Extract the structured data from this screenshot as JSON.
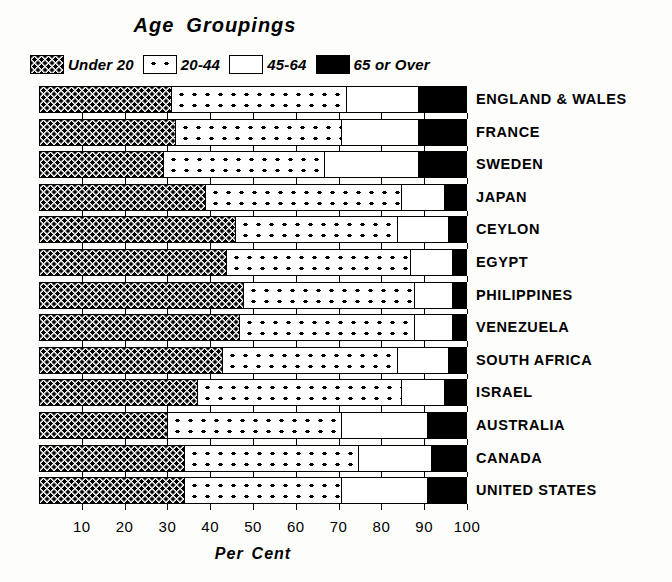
{
  "chart_data": {
    "type": "bar",
    "subtype": "stacked-horizontal-100-percent",
    "title_words": [
      "Age",
      "Groupings"
    ],
    "xlabel": "Per Cent",
    "xlabel_words": [
      "Per",
      "Cent"
    ],
    "ylabel": "",
    "xlim": [
      0,
      100
    ],
    "xticks": [
      10,
      20,
      30,
      40,
      50,
      60,
      70,
      80,
      90,
      100
    ],
    "xtick_labels": [
      "10",
      "20",
      "30",
      "40",
      "50",
      "60",
      "70",
      "80",
      "90",
      "100"
    ],
    "grid": false,
    "legend_position": "top",
    "categories": [
      "ENGLAND & WALES",
      "FRANCE",
      "SWEDEN",
      "JAPAN",
      "CEYLON",
      "EGYPT",
      "PHILIPPINES",
      "VENEZUELA",
      "SOUTH  AFRICA",
      "ISRAEL",
      "AUSTRALIA",
      "CANADA",
      "UNITED  STATES"
    ],
    "series": [
      {
        "name": "Under 20",
        "pattern": "dense-dots",
        "values": [
          31,
          32,
          29,
          39,
          46,
          44,
          48,
          47,
          43,
          37,
          30,
          34,
          34
        ]
      },
      {
        "name": "20-44",
        "pattern": "sparse-dots",
        "values": [
          41,
          39,
          38,
          46,
          38,
          43,
          40,
          41,
          41,
          48,
          41,
          41,
          37
        ]
      },
      {
        "name": "45-64",
        "pattern": "white",
        "values": [
          17,
          18,
          22,
          10,
          12,
          10,
          9,
          9,
          12,
          10,
          20,
          17,
          20
        ]
      },
      {
        "name": "65 or Over",
        "pattern": "black",
        "values": [
          11,
          11,
          11,
          5,
          4,
          3,
          3,
          3,
          4,
          5,
          9,
          8,
          9
        ]
      }
    ]
  },
  "legend": {
    "items": [
      {
        "label": "Under 20",
        "pattern": "dense-dots"
      },
      {
        "label": "20-44",
        "pattern": "sparse-dots"
      },
      {
        "label": "45-64",
        "pattern": "white"
      },
      {
        "label": "65 or Over",
        "pattern": "black"
      }
    ]
  },
  "colors": {
    "ink": "#000000",
    "paper": "#fdfdfb"
  }
}
